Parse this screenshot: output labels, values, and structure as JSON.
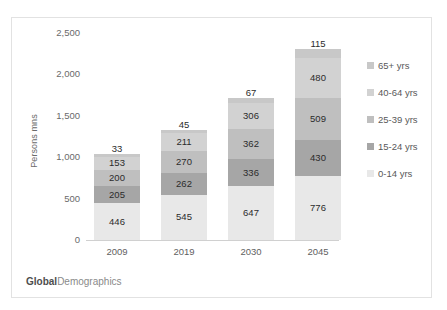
{
  "chart_data": {
    "type": "bar",
    "subtype": "stacked-column",
    "title": "",
    "xlabel": "",
    "ylabel": "Persons mns",
    "categories": [
      "2009",
      "2019",
      "2030",
      "2045"
    ],
    "ylim": [
      0,
      2500
    ],
    "yticks": [
      0,
      500,
      1000,
      1500,
      2000,
      2500
    ],
    "ytick_labels": [
      "0",
      "500",
      "1,000",
      "1,500",
      "2,000",
      "2,500"
    ],
    "grid": false,
    "legend_position": "right",
    "series": [
      {
        "name": "0-14 yrs",
        "values": [
          446,
          545,
          647,
          776
        ],
        "color": "#e8e8e8"
      },
      {
        "name": "15-24 yrs",
        "values": [
          205,
          262,
          336,
          430
        ],
        "color": "#a6a6a6"
      },
      {
        "name": "25-39 yrs",
        "values": [
          200,
          270,
          362,
          509
        ],
        "color": "#bfbfbf"
      },
      {
        "name": "40-64 yrs",
        "values": [
          153,
          211,
          306,
          480
        ],
        "color": "#d2d2d2"
      },
      {
        "name": "65+ yrs",
        "values": [
          33,
          45,
          67,
          115
        ],
        "color": "#c8c8c8"
      }
    ],
    "totals": [
      1037,
      1333,
      1718,
      2310
    ]
  },
  "legend": {
    "items": [
      {
        "label": "65+ yrs",
        "color": "#c8c8c8"
      },
      {
        "label": "40-64 yrs",
        "color": "#d2d2d2"
      },
      {
        "label": "25-39 yrs",
        "color": "#bfbfbf"
      },
      {
        "label": "15-24 yrs",
        "color": "#a6a6a6"
      },
      {
        "label": "0-14 yrs",
        "color": "#e8e8e8"
      }
    ]
  },
  "footer": {
    "brand_bold": "Global",
    "brand_regular": "Demographics"
  }
}
